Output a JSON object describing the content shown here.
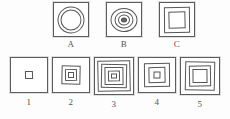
{
  "test": {
    "title": "Figure Analogy",
    "stem_labels": [
      "A",
      "B",
      "C"
    ],
    "option_labels": [
      "1",
      "2",
      "3",
      "4",
      "5"
    ]
  },
  "stems": [
    {
      "label": "A",
      "description": "square frame containing two concentric circles",
      "outer_shape": "square",
      "inner_shapes": [
        "circle",
        "circle"
      ],
      "ring_count": 2,
      "center_filled": false
    },
    {
      "label": "B",
      "description": "square frame containing three concentric circles with a dark center",
      "outer_shape": "square",
      "inner_shapes": [
        "circle",
        "circle",
        "circle"
      ],
      "ring_count": 3,
      "center_filled": true
    },
    {
      "label": "C",
      "description": "square frame containing two nested squares",
      "outer_shape": "square",
      "inner_shapes": [
        "square",
        "square"
      ],
      "ring_count": 2,
      "center_filled": false
    }
  ],
  "options": [
    {
      "label": "1",
      "description": "square frame containing one small square",
      "outer_shape": "square",
      "inner_shapes": [
        "square"
      ],
      "ring_count": 1,
      "center_filled": false
    },
    {
      "label": "2",
      "description": "square frame containing two nested squares",
      "outer_shape": "square",
      "inner_shapes": [
        "square",
        "square"
      ],
      "ring_count": 2,
      "center_filled": false
    },
    {
      "label": "3",
      "description": "square frame containing four nested squares",
      "outer_shape": "square",
      "inner_shapes": [
        "square",
        "square",
        "square",
        "square"
      ],
      "ring_count": 4,
      "center_filled": false
    },
    {
      "label": "4",
      "description": "square frame containing two nested squares with a small center",
      "outer_shape": "square",
      "inner_shapes": [
        "square",
        "square"
      ],
      "ring_count": 2,
      "center_filled": false
    },
    {
      "label": "5",
      "description": "square frame containing two nested squares with a large center",
      "outer_shape": "square",
      "inner_shapes": [
        "square",
        "square"
      ],
      "ring_count": 2,
      "center_filled": false
    }
  ],
  "colors": {
    "ink": "#555555",
    "paper": "#fdfdfd",
    "fill": "#6a6a6a"
  }
}
